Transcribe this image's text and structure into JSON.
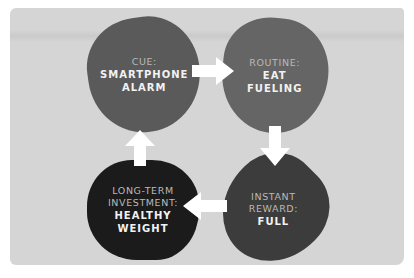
{
  "diagram": {
    "type": "habit-loop-cycle",
    "colors": {
      "background": "#ffffff",
      "card": "#d5d5d5",
      "arrow": "#ffffff",
      "label_text": "#b9b9b9",
      "value_text": "#f2f2f2"
    },
    "nodes": [
      {
        "id": "cue",
        "label": "CUE:",
        "value_lines": [
          "SMARTPHONE",
          "ALARM"
        ],
        "fill": "#5a5a5a"
      },
      {
        "id": "routine",
        "label": "ROUTINE:",
        "value_lines": [
          "EAT",
          "FUELING"
        ],
        "fill": "#656565"
      },
      {
        "id": "instant-reward",
        "label_lines": [
          "INSTANT",
          "REWARD:"
        ],
        "value_lines": [
          "FULL"
        ],
        "fill": "#3c3c3c"
      },
      {
        "id": "long-term-investment",
        "label_lines": [
          "LONG-TERM",
          "INVESTMENT:"
        ],
        "value_lines": [
          "HEALTHY",
          "WEIGHT"
        ],
        "fill": "#1b1b1b"
      }
    ],
    "edges": [
      {
        "from": "cue",
        "to": "routine",
        "direction": "right",
        "icon": "arrow-right-icon"
      },
      {
        "from": "routine",
        "to": "instant-reward",
        "direction": "down",
        "icon": "arrow-down-icon"
      },
      {
        "from": "instant-reward",
        "to": "long-term-investment",
        "direction": "left",
        "icon": "arrow-left-icon"
      },
      {
        "from": "long-term-investment",
        "to": "cue",
        "direction": "up",
        "icon": "arrow-up-icon"
      }
    ]
  }
}
